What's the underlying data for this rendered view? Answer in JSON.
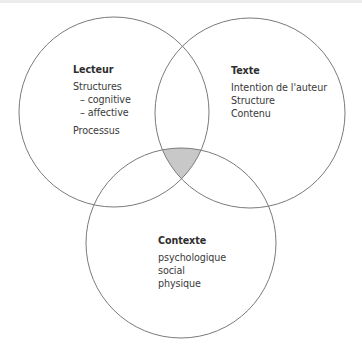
{
  "diagram": {
    "type": "venn",
    "colors": {
      "stroke": "#7a7a7a",
      "intersection_fill": "#c8c8c8",
      "background": "#ffffff",
      "text": "#3a3a3a"
    },
    "circles": [
      {
        "id": "lecteur",
        "title": "Lecteur",
        "items": [
          {
            "text": "Structures",
            "level": 0
          },
          {
            "text": "– cognitive",
            "level": 1
          },
          {
            "text": "– affective",
            "level": 1
          },
          {
            "text": "Processus",
            "level": 0
          }
        ]
      },
      {
        "id": "texte",
        "title": "Texte",
        "items": [
          {
            "text": "Intention de l'auteur",
            "level": 0
          },
          {
            "text": "Structure",
            "level": 0
          },
          {
            "text": "Contenu",
            "level": 0
          }
        ]
      },
      {
        "id": "contexte",
        "title": "Contexte",
        "items": [
          {
            "text": "psychologique",
            "level": 0
          },
          {
            "text": "social",
            "level": 0
          },
          {
            "text": "physique",
            "level": 0
          }
        ]
      }
    ],
    "highlight": "intersection of all three circles (shaded gray)"
  }
}
